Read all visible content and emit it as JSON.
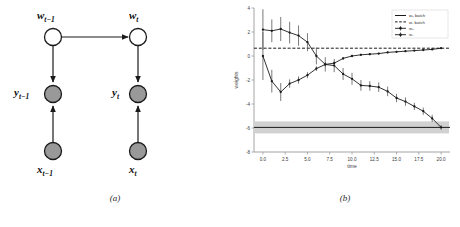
{
  "figure": {
    "panels": [
      {
        "caption": "(a)",
        "kind": "graphical-model"
      },
      {
        "caption": "(b)",
        "kind": "chart"
      }
    ]
  },
  "diagram": {
    "title": "",
    "nodes": [
      {
        "id": "w_tm1",
        "label_main": "w",
        "label_sub": "t−1",
        "shade": "open",
        "label_pos": "above"
      },
      {
        "id": "w_t",
        "label_main": "w",
        "label_sub": "t",
        "shade": "open",
        "label_pos": "above"
      },
      {
        "id": "y_tm1",
        "label_main": "y",
        "label_sub": "t−1",
        "shade": "filled",
        "label_pos": "left"
      },
      {
        "id": "y_t",
        "label_main": "y",
        "label_sub": "t",
        "shade": "filled",
        "label_pos": "left"
      },
      {
        "id": "x_tm1",
        "label_main": "x",
        "label_sub": "t−1",
        "shade": "filled",
        "label_pos": "below"
      },
      {
        "id": "x_t",
        "label_main": "x",
        "label_sub": "t",
        "shade": "filled",
        "label_pos": "below"
      }
    ],
    "edges": [
      {
        "from": "w_tm1",
        "to": "w_t",
        "direction": "right"
      },
      {
        "from": "w_tm1",
        "to": "y_tm1",
        "direction": "down"
      },
      {
        "from": "w_t",
        "to": "y_t",
        "direction": "down"
      },
      {
        "from": "x_tm1",
        "to": "y_tm1",
        "direction": "up"
      },
      {
        "from": "x_t",
        "to": "y_t",
        "direction": "up"
      }
    ],
    "colors": {
      "open_fill": "#ffffff",
      "filled_fill": "#999999",
      "stroke": "#1a1a1a"
    }
  },
  "chart_data": {
    "type": "line",
    "title": "",
    "xlabel": "time",
    "ylabel": "weights",
    "xlim": [
      -1.0,
      21.0
    ],
    "ylim": [
      -8,
      4
    ],
    "xticks": [
      "0.0",
      "2.5",
      "5.0",
      "7.5",
      "10.0",
      "12.5",
      "15.0",
      "17.5",
      "20.0"
    ],
    "xtick_values": [
      0.0,
      2.5,
      5.0,
      7.5,
      10.0,
      12.5,
      15.0,
      17.5,
      20.0
    ],
    "yticks": [
      "4",
      "2",
      "0",
      "-2",
      "-4",
      "-6",
      "-8"
    ],
    "ytick_values": [
      4,
      2,
      0,
      -2,
      -4,
      -6,
      -8
    ],
    "grid": false,
    "legend_position": "upper right",
    "legend": [
      {
        "label": "w₀ batch",
        "style": "solid-line",
        "color": "#1a1a1a"
      },
      {
        "label": "w₁ batch",
        "style": "dashed-line",
        "color": "#1a1a1a"
      },
      {
        "label": "w₀",
        "style": "marker-errorbar",
        "color": "#1a1a1a"
      },
      {
        "label": "w₁",
        "style": "marker-errorbar",
        "color": "#1a1a1a"
      }
    ],
    "reference_lines": [
      {
        "name": "w0_batch",
        "value": -5.95,
        "style": "solid",
        "color": "#1a1a1a"
      },
      {
        "name": "w1_batch",
        "value": 0.65,
        "style": "dashed",
        "color": "#1a1a1a"
      }
    ],
    "bands": [
      {
        "name": "w0_batch_band",
        "center": -5.95,
        "low": -6.45,
        "high": -5.45,
        "color": "#9a9a9a",
        "opacity": 0.45
      }
    ],
    "x": [
      0,
      1,
      2,
      3,
      4,
      5,
      6,
      7,
      8,
      9,
      10,
      11,
      12,
      13,
      14,
      15,
      16,
      17,
      18,
      19,
      20
    ],
    "series": [
      {
        "name": "w₀",
        "values": [
          2.2,
          2.1,
          2.25,
          1.95,
          1.7,
          1.15,
          0.0,
          -0.7,
          -0.8,
          -1.5,
          -1.9,
          -2.45,
          -2.5,
          -2.6,
          -2.95,
          -3.5,
          -3.8,
          -4.2,
          -4.6,
          -5.2,
          -5.95
        ],
        "errors": [
          1.7,
          0.95,
          1.0,
          0.9,
          0.85,
          0.75,
          0.7,
          0.6,
          0.55,
          0.5,
          0.5,
          0.45,
          0.4,
          0.4,
          0.4,
          0.35,
          0.35,
          0.3,
          0.3,
          0.3,
          0.2
        ]
      },
      {
        "name": "w₁",
        "values": [
          0.0,
          -2.1,
          -3.0,
          -2.3,
          -2.0,
          -1.6,
          -1.05,
          -0.7,
          -0.6,
          -0.2,
          0.0,
          0.1,
          0.15,
          0.2,
          0.3,
          0.35,
          0.4,
          0.45,
          0.5,
          0.55,
          0.65
        ],
        "errors": [
          2.0,
          0.95,
          0.75,
          0.35,
          0.3,
          0.25,
          0.2,
          0.18,
          0.15,
          0.12,
          0.1,
          0.09,
          0.08,
          0.08,
          0.07,
          0.07,
          0.06,
          0.06,
          0.05,
          0.05,
          0.04
        ]
      }
    ]
  }
}
